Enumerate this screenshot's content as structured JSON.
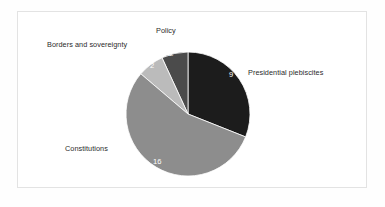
{
  "chart_data": {
    "type": "pie",
    "title": "",
    "total": 29,
    "categories": [
      "Presidential plebiscites",
      "Policy",
      "Borders and sovereignty",
      "Constitutions"
    ],
    "values": [
      9,
      2,
      2,
      16
    ],
    "labels_shown": [
      "9",
      "2",
      "2",
      "16"
    ],
    "colors": [
      "#1c1c1c",
      "#4b4b4b",
      "#bbbbbb",
      "#8d8d8d"
    ],
    "legend": "none",
    "grid": false,
    "slice_order": "clockwise from 12 o'clock: Presidential plebiscites; counterclockwise from 12 o'clock: Policy, Borders and sovereignty, Constitutions",
    "slices": [
      {
        "name": "Presidential plebiscites",
        "value": 9,
        "value_label": "9",
        "color": "#1c1c1c",
        "label_color": "#2b2b2b",
        "value_color": "#ffffff",
        "start_angle": 0,
        "end_angle": 111.7
      },
      {
        "name": "Policy",
        "value": 2,
        "value_label": "2",
        "color": "#4b4b4b",
        "label_color": "#2b2b2b",
        "value_color": "#ffffff",
        "start_angle": 335.2,
        "end_angle": 360
      },
      {
        "name": "Borders and sovereignty",
        "value": 2,
        "value_label": "2",
        "color": "#bbbbbb",
        "label_color": "#2b2b2b",
        "value_color": "#ffffff",
        "start_angle": 310.4,
        "end_angle": 335.2
      },
      {
        "name": "Constitutions",
        "value": 16,
        "value_label": "16",
        "color": "#8d8d8d",
        "label_color": "#2b2b2b",
        "value_color": "#ffffff",
        "start_angle": 111.7,
        "end_angle": 310.4
      }
    ],
    "geometry": {
      "center_x": 188,
      "center_y": 114,
      "radius": 62
    }
  },
  "figure": {
    "background": "#ffffff",
    "border_color": "#e3e3e3"
  }
}
